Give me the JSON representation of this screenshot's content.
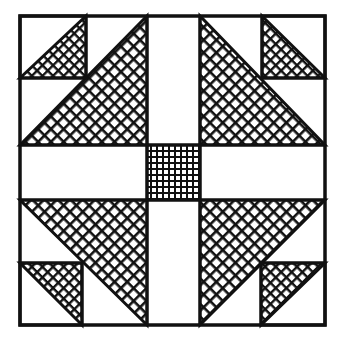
{
  "figure": {
    "canvas": {
      "width": 342,
      "height": 343
    },
    "colors": {
      "background": "#ffffff",
      "ink": "#111111"
    },
    "outer_square": {
      "x": 20,
      "y": 16,
      "width": 305,
      "height": 309
    },
    "center_strips": {
      "vertical": {
        "x1": 147,
        "x2": 200
      },
      "horizontal": {
        "y1": 145,
        "y2": 200
      }
    },
    "center_square": {
      "x": 147,
      "y": 145,
      "width": 53,
      "height": 55,
      "fill": "grid-hatch"
    },
    "large_triangles": [
      {
        "id": "top-left",
        "points": [
          [
            20,
            145
          ],
          [
            147,
            16
          ],
          [
            147,
            145
          ]
        ],
        "fill": "diagonal-crosshatch"
      },
      {
        "id": "top-right",
        "points": [
          [
            200,
            16
          ],
          [
            200,
            145
          ],
          [
            325,
            145
          ]
        ],
        "fill": "diagonal-crosshatch"
      },
      {
        "id": "bottom-left",
        "points": [
          [
            20,
            200
          ],
          [
            147,
            200
          ],
          [
            147,
            325
          ]
        ],
        "fill": "diagonal-crosshatch"
      },
      {
        "id": "bottom-right",
        "points": [
          [
            200,
            200
          ],
          [
            325,
            200
          ],
          [
            200,
            325
          ]
        ],
        "fill": "diagonal-crosshatch"
      }
    ],
    "small_squares": [
      {
        "id": "top-left",
        "x": 20,
        "y": 16,
        "width": 66,
        "height": 62,
        "triangle": [
          [
            20,
            78
          ],
          [
            86,
            16
          ],
          [
            86,
            78
          ]
        ]
      },
      {
        "id": "top-right",
        "x": 262,
        "y": 16,
        "width": 63,
        "height": 62,
        "triangle": [
          [
            262,
            16
          ],
          [
            262,
            78
          ],
          [
            325,
            78
          ]
        ]
      },
      {
        "id": "bottom-left",
        "x": 20,
        "y": 263,
        "width": 62,
        "height": 62,
        "triangle": [
          [
            20,
            263
          ],
          [
            82,
            263
          ],
          [
            82,
            325
          ]
        ]
      },
      {
        "id": "bottom-right",
        "x": 261,
        "y": 263,
        "width": 64,
        "height": 62,
        "triangle": [
          [
            261,
            263
          ],
          [
            325,
            263
          ],
          [
            261,
            325
          ]
        ]
      }
    ],
    "line_width": 3
  }
}
